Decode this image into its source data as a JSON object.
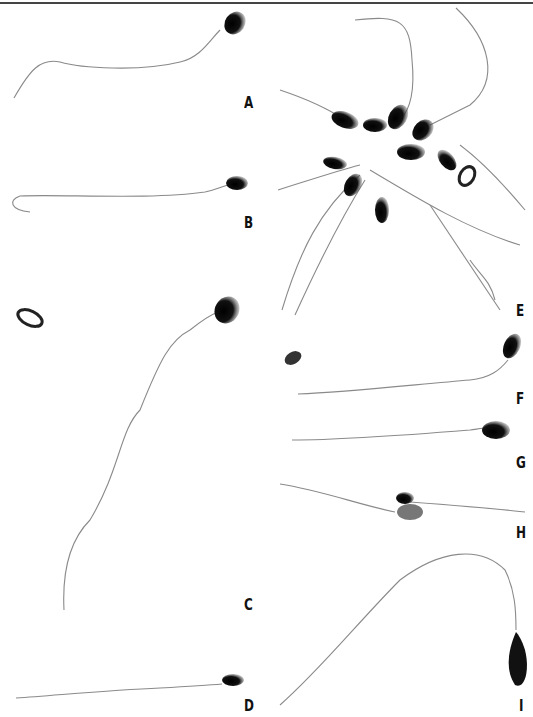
{
  "figure": {
    "panels": [
      {
        "label": "A",
        "x": 244,
        "y": 94
      },
      {
        "label": "B",
        "x": 244,
        "y": 214
      },
      {
        "label": "C",
        "x": 244,
        "y": 596
      },
      {
        "label": "D",
        "x": 244,
        "y": 697
      },
      {
        "label": "E",
        "x": 516,
        "y": 302
      },
      {
        "label": "F",
        "x": 516,
        "y": 390
      },
      {
        "label": "G",
        "x": 516,
        "y": 454
      },
      {
        "label": "H",
        "x": 516,
        "y": 524
      },
      {
        "label": "I",
        "x": 519,
        "y": 697
      }
    ],
    "colors": {
      "rule": "#444444",
      "cell": "#111111",
      "tail": "#8a8a8a",
      "background": "#ffffff"
    }
  }
}
